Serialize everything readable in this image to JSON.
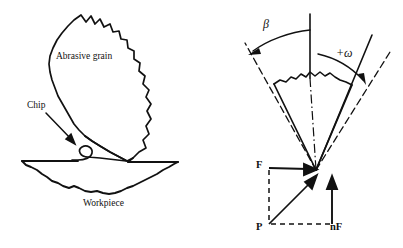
{
  "figure": {
    "background_color": "#ffffff",
    "ink_color": "#111111"
  },
  "left_panel": {
    "name": "abrasive-grain-cutting-schematic",
    "labels": {
      "grain": "Abrasive grain",
      "chip": "Chip",
      "workpiece": "Workpiece"
    }
  },
  "right_panel": {
    "name": "grinding-force-vector-diagram",
    "angles": {
      "beta": "β",
      "omega": "+ω"
    },
    "forces": {
      "tangential": "F",
      "normal": "nF",
      "resultant_origin": "P"
    }
  }
}
